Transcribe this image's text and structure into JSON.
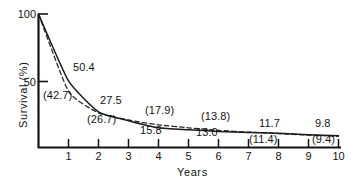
{
  "chart_data": {
    "type": "line",
    "title": "",
    "xlabel": "Years",
    "ylabel": "Survival (%)",
    "xlim": [
      0,
      10
    ],
    "ylim": [
      0,
      100
    ],
    "grid": false,
    "legend": "none",
    "x": [
      0,
      1,
      2,
      3,
      4,
      5,
      6,
      7,
      8,
      9,
      10
    ],
    "xticks": [
      "1",
      "2",
      "3",
      "4",
      "5",
      "6",
      "7",
      "8",
      "9",
      "10"
    ],
    "yticks": [
      "100",
      "50"
    ],
    "series": [
      {
        "name": "solid-curve",
        "style": "solid",
        "values": [
          100,
          50.4,
          27.5,
          21.0,
          15.8,
          14.3,
          13.0,
          12.3,
          11.7,
          10.6,
          9.8
        ]
      },
      {
        "name": "dashed-curve",
        "style": "dashed",
        "values": [
          100,
          42.7,
          26.7,
          21.5,
          17.9,
          15.7,
          13.8,
          12.5,
          11.4,
          10.3,
          9.4
        ]
      }
    ],
    "annotations": [
      {
        "text": "50.4",
        "series": "solid-curve",
        "year": 1,
        "value": 50.4
      },
      {
        "text": "(42.7)",
        "series": "dashed-curve",
        "year": 1,
        "value": 42.7
      },
      {
        "text": "27.5",
        "series": "solid-curve",
        "year": 2,
        "value": 27.5
      },
      {
        "text": "(26.7)",
        "series": "dashed-curve",
        "year": 2,
        "value": 26.7
      },
      {
        "text": "15.8",
        "series": "solid-curve",
        "year": 4,
        "value": 15.8
      },
      {
        "text": "(17.9)",
        "series": "dashed-curve",
        "year": 4,
        "value": 17.9
      },
      {
        "text": "13.0",
        "series": "solid-curve",
        "year": 6,
        "value": 13.0
      },
      {
        "text": "(13.8)",
        "series": "dashed-curve",
        "year": 6,
        "value": 13.8
      },
      {
        "text": "11.7",
        "series": "solid-curve",
        "year": 8,
        "value": 11.7
      },
      {
        "text": "(11.4)",
        "series": "dashed-curve",
        "year": 8,
        "value": 11.4
      },
      {
        "text": "9.8",
        "series": "solid-curve",
        "year": 10,
        "value": 9.8
      },
      {
        "text": "(9.4)",
        "series": "dashed-curve",
        "year": 10,
        "value": 9.4
      }
    ],
    "colors": {
      "axis": "#141414",
      "solid_line": "#1a1a1a",
      "dashed_line": "#2a2a2a",
      "background": "#ffffff",
      "text": "#131313"
    }
  },
  "annotation_labels": {
    "a0": "50.4",
    "a1": "(42.7)",
    "a2": "27.5",
    "a3": "(26.7)",
    "a4": "(17.9)",
    "a5": "15.8",
    "a6": "(13.8)",
    "a7": "13.0",
    "a8": "11.7",
    "a9": "(11.4)",
    "a10": "9.8",
    "a11": "(9.4)"
  },
  "axes": {
    "x_title": "Years",
    "y_title": "Survival (%)",
    "y_tick_100": "100",
    "y_tick_50": "50",
    "x_tick_1": "1",
    "x_tick_2": "2",
    "x_tick_3": "3",
    "x_tick_4": "4",
    "x_tick_5": "5",
    "x_tick_6": "6",
    "x_tick_7": "7",
    "x_tick_8": "8",
    "x_tick_9": "9",
    "x_tick_10": "10"
  }
}
